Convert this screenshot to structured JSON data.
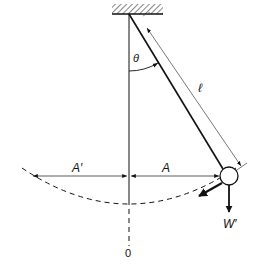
{
  "diagram": {
    "labels": {
      "theta": "θ",
      "length": "ℓ",
      "amplitude_right": "A",
      "amplitude_left": "A′",
      "weight": "W′",
      "origin": "0"
    },
    "colors": {
      "ink": "#111111",
      "background": "#ffffff"
    },
    "geometry": {
      "pivot": [
        129,
        14
      ],
      "bob_center": [
        229,
        176
      ],
      "bob_radius": 9,
      "ceiling": {
        "x1": 112,
        "x2": 163,
        "y": 14
      }
    }
  }
}
